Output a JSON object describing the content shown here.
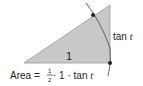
{
  "diagram": {
    "type": "geometry",
    "colors": {
      "triangle_fill": "#c8c8c8",
      "stroke": "#555555",
      "dot": "#222222",
      "text": "#222222"
    },
    "labels": {
      "base": "1",
      "side_word": "tan ",
      "side_var": "t",
      "area_prefix": "Area = ",
      "frac_num": "1",
      "frac_den": "2",
      "area_mid": " · 1 · tan ",
      "area_var": "t"
    }
  }
}
